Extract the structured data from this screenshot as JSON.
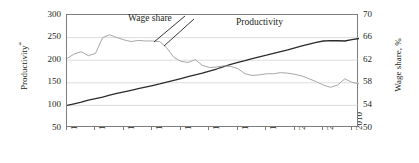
{
  "chart_data": {
    "type": "line",
    "title": "",
    "xlabel": "",
    "ylabel": "Productivity*",
    "y2label": "Wage share, %",
    "grid": true,
    "legend_position": "inline-annotations",
    "xlim": [
      1970,
      2011
    ],
    "ylim": [
      50,
      300
    ],
    "y2lim": [
      50,
      70
    ],
    "xticks": [
      1970,
      1974,
      1978,
      1982,
      1986,
      1990,
      1994,
      1998,
      2002,
      2006,
      2010
    ],
    "yticks": [
      50,
      100,
      150,
      200,
      250,
      300
    ],
    "y2ticks": [
      50,
      54,
      58,
      62,
      66,
      70
    ],
    "x": [
      1970,
      1971,
      1972,
      1973,
      1974,
      1975,
      1976,
      1977,
      1978,
      1979,
      1980,
      1981,
      1982,
      1983,
      1984,
      1985,
      1986,
      1987,
      1988,
      1989,
      1990,
      1991,
      1992,
      1993,
      1994,
      1995,
      1996,
      1997,
      1998,
      1999,
      2000,
      2001,
      2002,
      2003,
      2004,
      2005,
      2006,
      2007,
      2008,
      2009,
      2010,
      2011
    ],
    "series": [
      {
        "name": "Productivity",
        "axis": "left",
        "color": "#2b2b2b",
        "values": [
          100.0,
          103.5,
          107.0,
          111.5,
          115.0,
          118.5,
          122.5,
          126.5,
          130.0,
          133.5,
          137.0,
          140.5,
          144.0,
          147.5,
          151.5,
          155.5,
          159.5,
          163.5,
          167.5,
          171.5,
          176.0,
          180.5,
          186.0,
          190.5,
          195.0,
          199.0,
          203.5,
          207.5,
          211.0,
          215.0,
          219.0,
          223.0,
          227.5,
          231.5,
          235.5,
          239.5,
          242.5,
          243.5,
          243.0,
          242.5,
          245.5,
          248.0
        ]
      },
      {
        "name": "Wage share",
        "axis": "right",
        "color": "#a8a8a8",
        "values": [
          62.3,
          63.1,
          63.5,
          62.8,
          63.2,
          66.0,
          66.5,
          66.0,
          65.6,
          65.3,
          65.5,
          65.4,
          65.4,
          65.3,
          64.2,
          62.5,
          61.8,
          61.6,
          62.1,
          61.1,
          60.7,
          60.8,
          61.0,
          60.9,
          60.5,
          59.6,
          59.3,
          59.4,
          59.6,
          59.6,
          59.8,
          59.7,
          59.5,
          59.2,
          58.7,
          58.2,
          57.6,
          57.2,
          57.6,
          58.7,
          58.1,
          57.8
        ]
      }
    ],
    "annotations": [
      {
        "text": "Wage share",
        "points_to_series": "Wage share"
      },
      {
        "text": "Productivity",
        "points_to_series": "Productivity"
      }
    ]
  },
  "axes": {
    "left_title_text": "Productivity",
    "left_title_sup": "*",
    "right_title": "Wage share, %"
  },
  "annotations": {
    "wage_share": "Wage share",
    "productivity": "Productivity"
  },
  "style": {
    "productivity_color": "#2b2b2b",
    "wage_share_color": "#a8a8a8",
    "grid_color": "#cfcfcf",
    "frame_color": "#7d7d7d",
    "text_color": "#231f20",
    "background": "#ffffff"
  }
}
